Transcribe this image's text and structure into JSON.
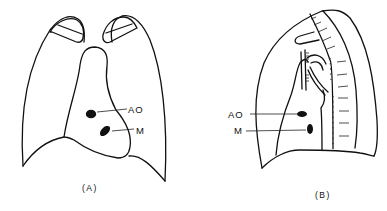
{
  "figure": {
    "panels": [
      {
        "id": "A",
        "caption": "(A)",
        "view": "frontal",
        "labels": {
          "aorta": "AO",
          "mitral": "M"
        }
      },
      {
        "id": "B",
        "caption": "(B)",
        "view": "lateral",
        "labels": {
          "aorta": "AO",
          "mitral": "M"
        }
      }
    ]
  }
}
